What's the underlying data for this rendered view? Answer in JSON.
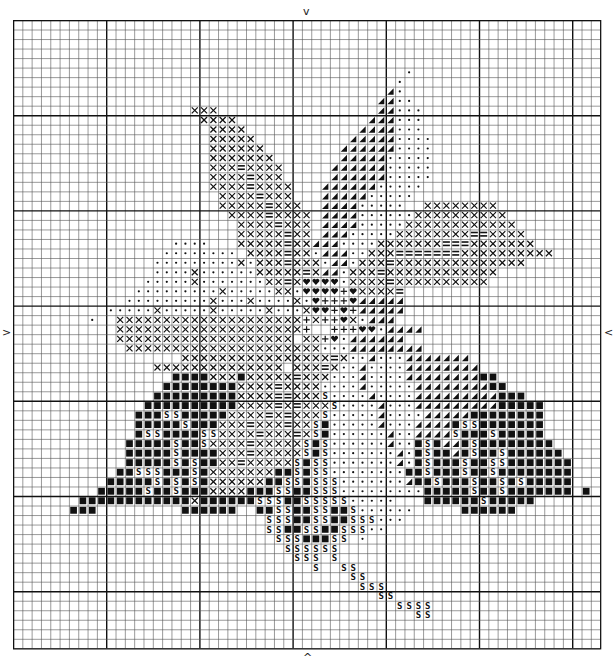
{
  "chart": {
    "columns": 63,
    "rows": 66,
    "cell_width": 9.32,
    "cell_height": 9.52,
    "major_every": 10,
    "major_col_offset": 0,
    "major_row_offset": 0,
    "grid_color": "#555555",
    "major_color": "#111111",
    "symbol_color": "#111111"
  },
  "center_markers": {
    "top": "v",
    "bottom": "^",
    "left": ">",
    "right": "<"
  },
  "legend_symbols": {
    "X": "cross",
    "=": "equals",
    ".": "dot",
    "T": "half-triangle",
    "H": "heart",
    "+": "plus",
    "B": "filled-square",
    "S": "s-letter"
  },
  "pattern_rows": [
    "---------------------------------------------------------------",
    "---------------------------------------------------------------",
    "---------------------------------------------------------------",
    "---------------------------------------------------------------",
    "---------------------------------------------------------------",
    "------------------------------------------.--------------------",
    "-----------------------------------------.---------------------",
    "----------------------------------------T.---------------------",
    "---------------------------------------TT..--------------------",
    "-------------------XXX-----------------TT...-------------------",
    "--------------------XXXX--------------TTT...-------------------",
    "---------------------XXXX------------TTTT...-------------------",
    "---------------------XXXXX----------TTTTT....------------------",
    "---------------------XXXXXX--------TTTTTT....------------------",
    "---------------------XXXXXXX-------TTTTT.....------------------",
    "---------------------XXX=XXXX-----TTTTTT.....------------------",
    "---------------------XXXX=XXX-----TTTTTT.....------------------",
    "---------------------XXXX=XXXX---TTTTTT.....-------------------",
    "----------------------XXXX=XXX---TTTTT.....--------------------",
    "----------------------XXXXX=XXX--TTTT.....--XXXXXXXX-----------",
    "-----------------------XXXX=XXXX-TTTT......XXXXXXXXXX----------",
    "------------------------XXXX=XXX-TTTT.....XXXXXXXXXXXX---------",
    "------------------------XXXXX=XX-TTT.....XXXXXXXX==XXXX--------",
    "-----------------....---XXXXX=XXTTT....XXXXXXX===XXXXXXX-------",
    "----------------........-XXXX=XX.TTT..XXX=======XXXXXXXXXX-----",
    "---------------.........X.XXX=XXX.TT.XXX=XXXXXXXXXXXXXX--------",
    "---------------....X......XXXXX=XTT.XXX=XXXXXXXXXXXX-----------",
    "--------------.....X.......XX=XHHHH.XXXX=XXXXXXXXXX------------",
    "-------------.........X.....XX.HHHH+HXXXX=---------------------",
    "------------.........X...X....X.H+++HTTTTT---------------------",
    "----------.....X.....X.....X...XHH+H+TTTTT---------------------",
    "--------.--XXXXXXXXXXXXXXXXXXXX+X++HX.TTT----------------------",
    "-----------XXXXXXXXXXXXXXXXXXXX+--+++HH.TTTT-------------------",
    "-----------XXXXXXXXXXXXXXXXXXX-XX+H.TTTTTT---------------------",
    "------------XXXXXXXXXXXXXXXXXXXXX...TTTTTTTT-------------------",
    "------------------XXXXXXXXXXXXXXXX=X..T...TTTTTTT--------------",
    "---------------XXXXXXXXXXXXXX-XXX=X..T....TTTTTTTT-------------",
    "-----------------BBBBXXXBXXXXX=XXX...T....TTTTTTTTBB-----------",
    "----------------BBBBBBBBXXXX=XXXX....T.....TTTTTTTTBB----------",
    "---------------BBBBBBBBBXXXX==XXXS....T....TTTTTTTTTBBB--------",
    "--------------BBBBBBBBBBXXXX=X=XXXS....T...TTTTTTTTTBBBBB------",
    "-------------BBBSSBBBBBXXXX=X=XXXS.....T....TTTTTBBBBBBBB------",
    "-------------BBBBBSBBBXXX=XXX=XXSB.....T...TTTTBSSBBBBBBB------",
    "-------------BSSBBBBSSXXXX=XXX=XSB......T..TTTTSBBBSBBBBB------",
    "------------BBBBBSBBSXXXX=XXXXXSBS......T..BSBTTBSBBBBBBBB-----",
    "------------BBBBBSBBBBXXX=XXXXXSBS.......T.BSBBTBSBBSBBBBBB----",
    "------------BBBBBSBSBBXX=XXXXXSBSS.......T.BSBBBSBBSSBBBBBBB---",
    "-----------BBSSSBBBSBXXXXXXXBBSBSS........BBSBBBSBBSBBBBBBBB---",
    "----------BBBBBSBSBSBXXXXXXBBSSBSSS.......TBBSBBBSBBSBSBBBBB---",
    "---------BBBBBSBBSBBBXXXXBBBSSBBSSS.........BBBBBSBBSBBBBBBB-B-",
    "-------BBBBBBBBBBBBXBBBBBBSSSBBSSSSS.....---BBBBBBSBBBBB-------",
    "------BBB---------BBBBBB--BBSSBBSSBBS......-----BBBBBB---------",
    "---------------------------SSSBBSSBBSSS...---------------------",
    "---------------------------SSBBSSBBSSS..-----------------------",
    "----------------------------SSSBBBSS-.-------------------------",
    "-----------------------------SSSSSS----------------------------",
    "------------------------------SSS-S----------------------------",
    "--------------------------------S--SS--------------------------",
    "------------------------------------SS-------------------------",
    "-------------------------------------SSS-----------------------",
    "---------------------------------------SS----------------------",
    "-----------------------------------------SSSS------------------",
    "-------------------------------------------SS------------------",
    "---------------------------------------------------------------",
    "---------------------------------------------------------------",
    "---------------------------------------------------------------"
  ]
}
